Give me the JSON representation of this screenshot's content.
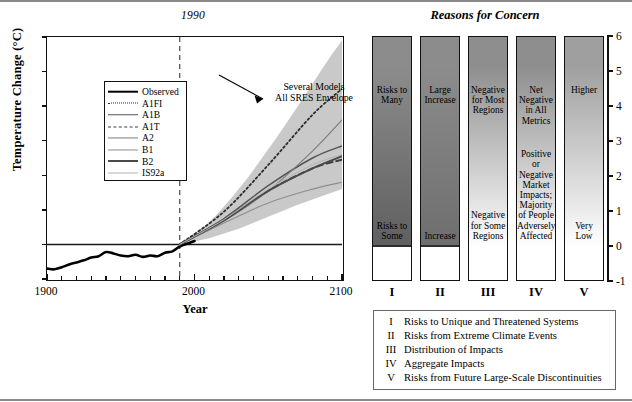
{
  "left_panel": {
    "period_marker_label": "1990",
    "y_axis_title": "Temperature Change (°C)",
    "x_axis_title": "Year",
    "y_ticks": [
      "6",
      "5",
      "4",
      "3",
      "2",
      "1",
      "0",
      "-1"
    ],
    "x_ticks": [
      "1900",
      "2000",
      "2100"
    ],
    "annotation_line1": "Several Models",
    "annotation_line2": "All SRES Envelope",
    "legend_title": "",
    "legend_items": [
      {
        "label": "Observed",
        "style": "solid",
        "width": 2.6,
        "color": "#000000"
      },
      {
        "label": "A1FI",
        "style": "dotted",
        "width": 1.8,
        "color": "#2b2b2b"
      },
      {
        "label": "A1B",
        "style": "solid",
        "width": 1.5,
        "color": "#555555"
      },
      {
        "label": "A1T",
        "style": "dashed",
        "width": 1.9,
        "color": "#3d3d3d"
      },
      {
        "label": "A2",
        "style": "solid",
        "width": 1.1,
        "color": "#7b7b7b"
      },
      {
        "label": "B1",
        "style": "solid",
        "width": 1.1,
        "color": "#8e8e8e"
      },
      {
        "label": "B2",
        "style": "solid",
        "width": 2.0,
        "color": "#4a4a4a"
      },
      {
        "label": "IS92a",
        "style": "solid",
        "width": 1.0,
        "color": "#b4b4b4"
      }
    ]
  },
  "right_panel": {
    "title": "Reasons for Concern",
    "y_ticks": [
      "6",
      "5",
      "4",
      "3",
      "2",
      "1",
      "0",
      "-1"
    ],
    "roman_labels": [
      "I",
      "II",
      "III",
      "IV",
      "V"
    ],
    "bars": [
      {
        "roman": "I",
        "top_text": "Risks to\nMany",
        "bottom_text": "Risks to\nSome",
        "top_shade": "#8c8c8c",
        "zero_shade": "#5f5f5f",
        "hard_zero_line": true
      },
      {
        "roman": "II",
        "top_text": "Large\nIncrease",
        "bottom_text": "Increase",
        "top_shade": "#8c8c8c",
        "zero_shade": "#6e6e6e",
        "hard_zero_line": true
      },
      {
        "roman": "III",
        "top_text": "Negative\nfor Most\nRegions",
        "bottom_text": "Negative\nfor Some\nRegions",
        "top_shade": "#8e8e8e",
        "zero_shade": "#ffffff",
        "hard_zero_line": false
      },
      {
        "roman": "IV",
        "top_text": "Net\nNegative\nin All\nMetrics",
        "bottom_text": "Positive\nor\nNegative\nMarket\nImpacts;\nMajority\nof People\nAdversely\nAffected",
        "top_shade": "#8e8e8e",
        "zero_shade": "#ffffff",
        "hard_zero_line": false
      },
      {
        "roman": "V",
        "top_text": "Higher",
        "bottom_text": "Very\nLow",
        "top_shade": "#9f9f9f",
        "zero_shade": "#ffffff",
        "hard_zero_line": false
      }
    ],
    "legend_entries": [
      {
        "numeral": "I",
        "description": "Risks to Unique and Threatened Systems"
      },
      {
        "numeral": "II",
        "description": "Risks from Extreme Climate Events"
      },
      {
        "numeral": "III",
        "description": "Distribution of Impacts"
      },
      {
        "numeral": "IV",
        "description": "Aggregate Impacts"
      },
      {
        "numeral": "V",
        "description": "Risks from Future Large-Scale Discontinuities"
      }
    ]
  },
  "chart_data": {
    "type": "line",
    "title": "",
    "xlabel": "Year",
    "ylabel": "Temperature Change (°C)",
    "xlim": [
      1900,
      2100
    ],
    "ylim": [
      -1,
      6
    ],
    "grid": false,
    "legend_position": "upper-left-inset",
    "annotations": [
      {
        "text": "Several Models All SRES Envelope",
        "x": 2050,
        "y": 5.2
      },
      {
        "text": "1990",
        "x": 1990,
        "y": 6.4,
        "type": "vertical-dashed-marker"
      }
    ],
    "bands": [
      {
        "name": "All SRES Envelope",
        "color": "#c9c9c9",
        "x": [
          1990,
          2010,
          2030,
          2050,
          2070,
          2090,
          2100
        ],
        "upper": [
          0.05,
          0.65,
          1.6,
          2.75,
          4.0,
          5.3,
          5.9
        ],
        "lower": [
          0.0,
          0.18,
          0.45,
          0.8,
          1.15,
          1.45,
          1.6
        ]
      }
    ],
    "series": [
      {
        "name": "Observed",
        "style": "solid",
        "color": "#000000",
        "x": [
          1900,
          1905,
          1910,
          1915,
          1920,
          1925,
          1930,
          1935,
          1940,
          1945,
          1950,
          1955,
          1960,
          1965,
          1970,
          1975,
          1980,
          1985,
          1990,
          1995,
          2000
        ],
        "y": [
          -0.7,
          -0.72,
          -0.66,
          -0.58,
          -0.52,
          -0.46,
          -0.38,
          -0.34,
          -0.22,
          -0.26,
          -0.32,
          -0.34,
          -0.3,
          -0.36,
          -0.32,
          -0.34,
          -0.24,
          -0.2,
          -0.06,
          0.02,
          0.1
        ]
      },
      {
        "name": "A1FI",
        "style": "dotted",
        "color": "#2b2b2b",
        "x": [
          1990,
          2020,
          2050,
          2080,
          2100
        ],
        "y": [
          0.0,
          0.95,
          2.3,
          3.75,
          4.5
        ]
      },
      {
        "name": "A1B",
        "style": "solid",
        "color": "#555555",
        "x": [
          1990,
          2020,
          2050,
          2080,
          2100
        ],
        "y": [
          0.0,
          0.75,
          1.7,
          2.5,
          2.85
        ]
      },
      {
        "name": "A1T",
        "style": "dashed",
        "color": "#3d3d3d",
        "x": [
          1990,
          2020,
          2050,
          2080,
          2100
        ],
        "y": [
          0.0,
          0.7,
          1.55,
          2.2,
          2.45
        ]
      },
      {
        "name": "A2",
        "style": "solid",
        "color": "#7b7b7b",
        "x": [
          1990,
          2020,
          2050,
          2080,
          2100
        ],
        "y": [
          0.0,
          0.68,
          1.55,
          2.7,
          3.6
        ]
      },
      {
        "name": "B1",
        "style": "solid",
        "color": "#8e8e8e",
        "x": [
          1990,
          2020,
          2050,
          2080,
          2100
        ],
        "y": [
          0.0,
          0.62,
          1.2,
          1.6,
          1.8
        ]
      },
      {
        "name": "B2",
        "style": "solid",
        "color": "#4a4a4a",
        "x": [
          1990,
          2020,
          2050,
          2080,
          2100
        ],
        "y": [
          0.0,
          0.7,
          1.55,
          2.2,
          2.55
        ]
      },
      {
        "name": "IS92a",
        "style": "solid",
        "color": "#b4b4b4",
        "x": [
          1990,
          2020,
          2050,
          2080,
          2100
        ],
        "y": [
          0.0,
          0.72,
          1.6,
          2.3,
          2.6
        ]
      }
    ]
  }
}
